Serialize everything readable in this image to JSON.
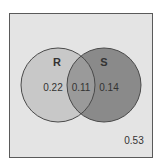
{
  "diagram": {
    "type": "venn",
    "colors": {
      "background": "#ffffff",
      "universe_fill": "#e4e4e4",
      "universe_stroke": "#5a5a5a",
      "circle_r_fill": "#c8c8c8",
      "circle_s_fill": "#8a8a8a",
      "intersection_fill": "#9a9a9a",
      "circle_stroke": "#4a4a4a",
      "text": "#333333"
    },
    "sets": [
      {
        "label": "R",
        "only_value": "0.22"
      },
      {
        "label": "S",
        "only_value": "0.14"
      }
    ],
    "intersection_value": "0.11",
    "outside_value": "0.53"
  }
}
